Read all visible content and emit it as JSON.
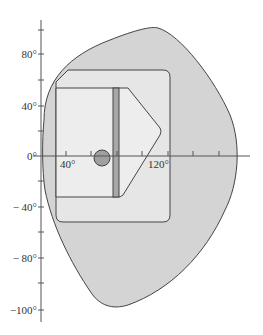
{
  "figure": {
    "type": "visual-field-diagram",
    "y_axis": {
      "labels": [
        {
          "text": "80°",
          "value": 80
        },
        {
          "text": "40°",
          "value": 40
        },
        {
          "text": "0°",
          "value": 0
        },
        {
          "text": "− 40°",
          "value": -40
        },
        {
          "text": "− 80°",
          "value": -80
        },
        {
          "text": "−100°",
          "value": -100
        }
      ]
    },
    "x_axis": {
      "labels": [
        {
          "text": "40°",
          "value": 40
        },
        {
          "text": "120°",
          "value": 120
        }
      ]
    },
    "regions": [
      {
        "name": "outer-field",
        "fill": "#d4d4d4"
      },
      {
        "name": "inner-rounded-field",
        "fill": "#e6e6e6"
      },
      {
        "name": "central-panel",
        "fill": "#ededed"
      },
      {
        "name": "vertical-bar",
        "fill": "#a8a8a8"
      },
      {
        "name": "blind-spot",
        "fill": "#a0a0a0"
      }
    ],
    "colors": {
      "stroke": "#444444",
      "axis": "#555555"
    }
  }
}
